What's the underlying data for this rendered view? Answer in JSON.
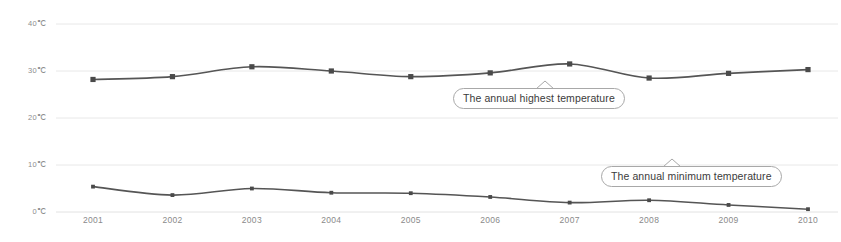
{
  "chart_data": {
    "type": "line",
    "title": "",
    "xlabel": "",
    "ylabel": "",
    "x": [
      2001,
      2002,
      2003,
      2004,
      2005,
      2006,
      2007,
      2008,
      2009,
      2010
    ],
    "categories": [
      "2001",
      "2002",
      "2003",
      "2004",
      "2005",
      "2006",
      "2007",
      "2008",
      "2009",
      "2010"
    ],
    "ylim": [
      0,
      40
    ],
    "yticks": [
      0,
      10,
      20,
      30,
      40
    ],
    "ytick_labels": [
      "0℃",
      "10℃",
      "20℃",
      "30℃",
      "40℃"
    ],
    "grid": true,
    "grid_axis": "y",
    "legend": "none",
    "marker": "square",
    "series": [
      {
        "name": "The annual highest temperature",
        "values": [
          28.2,
          28.8,
          30.9,
          30.0,
          28.8,
          29.6,
          31.5,
          28.5,
          29.5,
          30.3
        ],
        "color": "#555555"
      },
      {
        "name": "The annual minimum temperature",
        "values": [
          5.4,
          3.6,
          5.0,
          4.1,
          4.0,
          3.2,
          2.0,
          2.5,
          1.5,
          0.6
        ],
        "color": "#555555"
      }
    ],
    "annotations": [
      {
        "text": "The annual highest temperature",
        "attached_series": "The annual highest temperature",
        "x_px": 453,
        "y_px": 88,
        "tail_x_px": 545
      },
      {
        "text": "The annual minimum temperature",
        "attached_series": "The annual minimum temperature",
        "x_px": 601,
        "y_px": 166,
        "tail_x_px": 672
      }
    ],
    "colors": {
      "line": "#555555",
      "marker": "#4a4a4a",
      "grid": "#e2e2e2",
      "axis_text": "#8a8a8a",
      "callout_border": "#a8a8a8",
      "background": "#ffffff"
    }
  },
  "axes": {
    "y_labels": [
      {
        "text": "40℃",
        "value": 40
      },
      {
        "text": "30℃",
        "value": 30
      },
      {
        "text": "20℃",
        "value": 20
      },
      {
        "text": "10℃",
        "value": 10
      },
      {
        "text": "0℃",
        "value": 0
      }
    ],
    "x_labels": [
      {
        "text": "2001"
      },
      {
        "text": "2002"
      },
      {
        "text": "2003"
      },
      {
        "text": "2004"
      },
      {
        "text": "2005"
      },
      {
        "text": "2006"
      },
      {
        "text": "2007"
      },
      {
        "text": "2008"
      },
      {
        "text": "2009"
      },
      {
        "text": "2010"
      }
    ]
  },
  "callouts": {
    "highest": "The annual highest temperature",
    "minimum": "The annual minimum temperature"
  }
}
